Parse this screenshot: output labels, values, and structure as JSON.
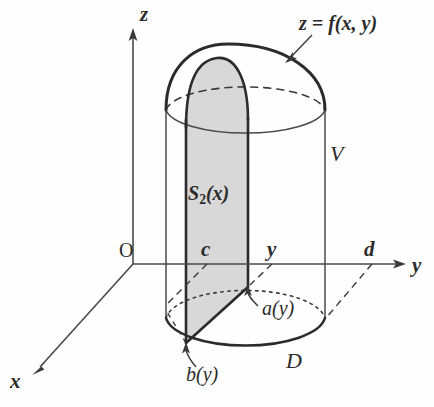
{
  "figure": {
    "background_color": "#fefefe",
    "line_color": "#2b2b2b",
    "shade_color": "#d8d8d8"
  },
  "axes": {
    "z_label": "z",
    "y_label": "y",
    "x_label": "x",
    "origin_label": "O"
  },
  "ticks": {
    "c": "c",
    "y": "y",
    "d": "d"
  },
  "labels": {
    "surface": "z = f(x, y)",
    "solid": "V",
    "region": "D",
    "cross_section_base": "S",
    "cross_section_sub": "2",
    "cross_section_arg": "(x)",
    "lower_boundary": "a(y)",
    "upper_boundary": "b(y)"
  },
  "geometry": {
    "origin": [
      133,
      264
    ],
    "z_axis_top": [
      133,
      30
    ],
    "y_axis_end": [
      405,
      264
    ],
    "x_axis_end": [
      32,
      375
    ],
    "cylinder_left_x": 166,
    "cylinder_right_x": 325,
    "top_rim_center": [
      245,
      110
    ],
    "base_center": [
      245,
      318
    ],
    "rim_rx": 80,
    "rim_ry": 26,
    "dome_apex": [
      228,
      58
    ],
    "slab_left_x": 186,
    "slab_right_x": 248,
    "slab_front_point": [
      248,
      287
    ],
    "slab_base_point": [
      186,
      343
    ]
  }
}
